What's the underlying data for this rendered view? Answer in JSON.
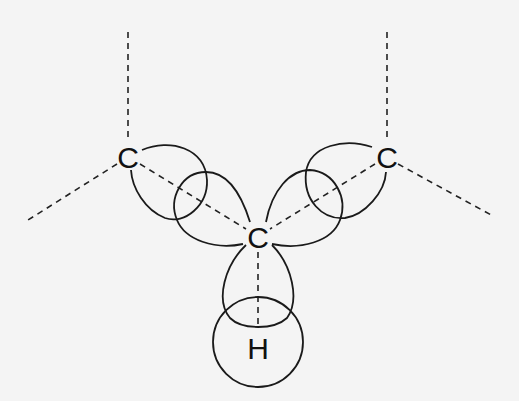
{
  "diagram": {
    "type": "orbital-overlap-diagram",
    "background": "#f4f4f4",
    "stroke_color": "#1a1a1a",
    "atoms": [
      {
        "id": "c_left",
        "label": "C",
        "x": 128,
        "y": 157
      },
      {
        "id": "c_right",
        "label": "C",
        "x": 387,
        "y": 157
      },
      {
        "id": "c_center",
        "label": "C",
        "x": 258,
        "y": 237
      },
      {
        "id": "h",
        "label": "H",
        "x": 258,
        "y": 345
      }
    ],
    "bonds_dashed": [
      {
        "from": "c_left",
        "to": "top-left-end",
        "x1": 128,
        "y1": 32,
        "x2": 128,
        "y2": 142
      },
      {
        "from": "c_left",
        "to": "lower-left-end",
        "x1": 117,
        "y1": 164,
        "x2": 28,
        "y2": 220
      },
      {
        "from": "c_right",
        "to": "top-right-end",
        "x1": 387,
        "y1": 32,
        "x2": 387,
        "y2": 142
      },
      {
        "from": "c_right",
        "to": "lower-right-end",
        "x1": 398,
        "y1": 164,
        "x2": 493,
        "y2": 216
      },
      {
        "from": "c_left",
        "to": "c_center",
        "x1": 140,
        "y1": 164,
        "x2": 246,
        "y2": 229
      },
      {
        "from": "c_right",
        "to": "c_center",
        "x1": 375,
        "y1": 164,
        "x2": 270,
        "y2": 229
      },
      {
        "from": "c_center",
        "to": "h",
        "x1": 258,
        "y1": 252,
        "x2": 258,
        "y2": 326
      }
    ],
    "h_orbital": {
      "cx": 258,
      "cy": 342,
      "r": 45
    },
    "labels": {
      "c_left": "C",
      "c_right": "C",
      "c_center": "C",
      "h": "H"
    }
  }
}
